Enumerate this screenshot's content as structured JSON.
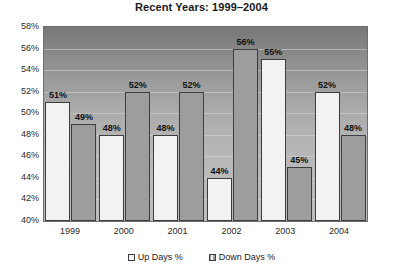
{
  "chart_data": {
    "type": "bar",
    "title": "Recent Years: 1999–2004",
    "xlabel": "",
    "ylabel": "",
    "categories": [
      "1999",
      "2000",
      "2001",
      "2002",
      "2003",
      "2004"
    ],
    "series": [
      {
        "name": "Up Days %",
        "values": [
          51,
          48,
          48,
          44,
          55,
          52
        ],
        "color": "#f2f2f2"
      },
      {
        "name": "Down Days %",
        "values": [
          49,
          52,
          52,
          56,
          45,
          48
        ],
        "color": "#9d9d9d"
      }
    ],
    "data_labels": [
      [
        "51%",
        "48%",
        "48%",
        "44%",
        "55%",
        "52%"
      ],
      [
        "49%",
        "52%",
        "52%",
        "56%",
        "45%",
        "48%"
      ]
    ],
    "ylim": [
      40,
      58
    ],
    "ytick_step": 2,
    "yticks": [
      "40%",
      "42%",
      "44%",
      "46%",
      "48%",
      "50%",
      "52%",
      "54%",
      "56%",
      "58%"
    ],
    "grid": true,
    "legend_position": "bottom"
  },
  "legend": {
    "items": [
      {
        "label": "Up Days %",
        "swatch": "up"
      },
      {
        "label": "Down Days %",
        "swatch": "down"
      }
    ]
  }
}
